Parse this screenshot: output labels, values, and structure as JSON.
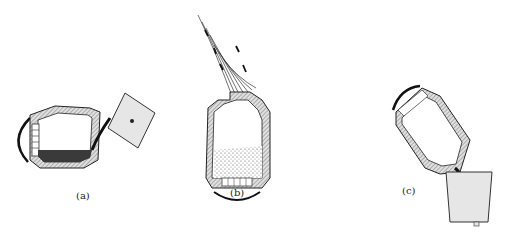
{
  "figure": {
    "panels": [
      {
        "id": "a",
        "label": "(a)",
        "description": "converter tilted horizontally, pouring molten contents into ladle"
      },
      {
        "id": "b",
        "label": "(b)",
        "description": "converter upright with charge, blowing flame and sparks out of mouth"
      },
      {
        "id": "c",
        "label": "(c)",
        "description": "converter tilted pouring into a bucket-shaped ladle"
      }
    ]
  },
  "colors": {
    "outline": "#222222",
    "lining": "#bdbdbd",
    "molten": "#3a3a3a",
    "ladle": "#e6e6e6",
    "background": "#ffffff"
  }
}
